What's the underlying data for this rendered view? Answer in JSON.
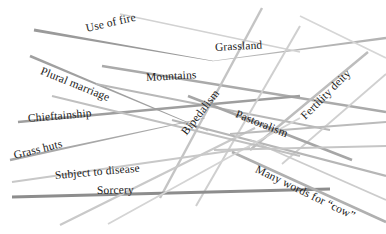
{
  "figure": {
    "background_color": "#ffffff",
    "width": 386,
    "height": 234
  },
  "labels": [
    {
      "text": "Use of fire",
      "x": 86,
      "y": 23,
      "rotate": -13,
      "size": 11.5
    },
    {
      "text": "Grassland",
      "x": 215,
      "y": 42,
      "rotate": -3,
      "size": 11.5
    },
    {
      "text": "Plural marriage",
      "x": 41,
      "y": 65,
      "rotate": 22,
      "size": 11.5
    },
    {
      "text": "Mountains",
      "x": 146,
      "y": 72,
      "rotate": -3,
      "size": 11.5
    },
    {
      "text": "Bipedalism",
      "x": 184,
      "y": 128,
      "rotate": -52,
      "size": 11.5
    },
    {
      "text": "Fertility deity",
      "x": 303,
      "y": 112,
      "rotate": -45,
      "size": 11.5
    },
    {
      "text": "Chieftainship",
      "x": 28,
      "y": 113,
      "rotate": -5,
      "size": 11.5
    },
    {
      "text": "Pastoralism",
      "x": 236,
      "y": 108,
      "rotate": 22,
      "size": 11.5
    },
    {
      "text": "Grass huts",
      "x": 14,
      "y": 150,
      "rotate": -14,
      "size": 11.5
    },
    {
      "text": "Subject to disease",
      "x": 55,
      "y": 170,
      "rotate": -5,
      "size": 11.5
    },
    {
      "text": "Sorcery",
      "x": 97,
      "y": 185,
      "rotate": -1,
      "size": 11.5
    },
    {
      "text": "Many words for “cow”",
      "x": 256,
      "y": 163,
      "rotate": 26,
      "size": 11.5
    }
  ],
  "lines": [
    {
      "name": "line-use-of-fire",
      "x1": 34,
      "y1": 30,
      "x2": 213,
      "y2": 61,
      "width": 3.0,
      "color": "#9a9a9a",
      "taper": "right"
    },
    {
      "name": "line-grassland-long",
      "x1": 213,
      "y1": 61,
      "x2": 386,
      "y2": 38,
      "width": 2.6,
      "color": "#b4b4b4",
      "taper": "left"
    },
    {
      "name": "line-grassland-upper",
      "x1": 120,
      "y1": 14,
      "x2": 300,
      "y2": 52,
      "width": 1.6,
      "color": "#d2d2d2",
      "taper": "none"
    },
    {
      "name": "line-plural-marriage",
      "x1": 30,
      "y1": 56,
      "x2": 208,
      "y2": 131,
      "width": 2.8,
      "color": "#a0a0a0",
      "taper": "right"
    },
    {
      "name": "line-mountains-upper",
      "x1": 102,
      "y1": 66,
      "x2": 386,
      "y2": 112,
      "width": 2.4,
      "color": "#aaaaaa",
      "taper": "none"
    },
    {
      "name": "line-mountains-lower",
      "x1": 96,
      "y1": 84,
      "x2": 330,
      "y2": 130,
      "width": 2.2,
      "color": "#b8b8b8",
      "taper": "none"
    },
    {
      "name": "line-chieftainship",
      "x1": 18,
      "y1": 122,
      "x2": 300,
      "y2": 96,
      "width": 2.6,
      "color": "#9e9e9e",
      "taper": "none"
    },
    {
      "name": "line-bipedalism-steep",
      "x1": 160,
      "y1": 198,
      "x2": 262,
      "y2": 8,
      "width": 2.4,
      "color": "#c4c4c4",
      "taper": "none"
    },
    {
      "name": "line-bipedalism-steep2",
      "x1": 196,
      "y1": 206,
      "x2": 300,
      "y2": 26,
      "width": 2.0,
      "color": "#cfcfcf",
      "taper": "none"
    },
    {
      "name": "line-fertility-deity",
      "x1": 250,
      "y1": 150,
      "x2": 368,
      "y2": 52,
      "width": 2.4,
      "color": "#bdbdbd",
      "taper": "none"
    },
    {
      "name": "line-fertility-deity2",
      "x1": 282,
      "y1": 164,
      "x2": 386,
      "y2": 74,
      "width": 1.8,
      "color": "#d0d0d0",
      "taper": "none"
    },
    {
      "name": "line-pastoralism",
      "x1": 188,
      "y1": 96,
      "x2": 352,
      "y2": 160,
      "width": 2.6,
      "color": "#a6a6a6",
      "taper": "none"
    },
    {
      "name": "line-pastoralism2",
      "x1": 172,
      "y1": 120,
      "x2": 386,
      "y2": 176,
      "width": 2.2,
      "color": "#b6b6b6",
      "taper": "none"
    },
    {
      "name": "line-grass-huts",
      "x1": 10,
      "y1": 160,
      "x2": 205,
      "y2": 118,
      "width": 2.6,
      "color": "#a8a8a8",
      "taper": "right"
    },
    {
      "name": "line-subject-disease",
      "x1": 12,
      "y1": 182,
      "x2": 250,
      "y2": 148,
      "width": 2.2,
      "color": "#c8c8c8",
      "taper": "none"
    },
    {
      "name": "line-sorcery-baseline",
      "x1": 12,
      "y1": 197,
      "x2": 330,
      "y2": 189,
      "width": 3.2,
      "color": "#8d8d8d",
      "taper": "none"
    },
    {
      "name": "line-many-words-cow",
      "x1": 232,
      "y1": 152,
      "x2": 386,
      "y2": 222,
      "width": 2.6,
      "color": "#b0b0b0",
      "taper": "none"
    },
    {
      "name": "line-many-words-cow2",
      "x1": 250,
      "y1": 140,
      "x2": 386,
      "y2": 200,
      "width": 1.8,
      "color": "#cccccc",
      "taper": "none"
    },
    {
      "name": "line-lower-left-rise",
      "x1": 60,
      "y1": 225,
      "x2": 255,
      "y2": 128,
      "width": 2.2,
      "color": "#c9c9c9",
      "taper": "none"
    },
    {
      "name": "line-lower-left-rise2",
      "x1": 108,
      "y1": 224,
      "x2": 300,
      "y2": 118,
      "width": 1.8,
      "color": "#d4d4d4",
      "taper": "none"
    },
    {
      "name": "line-mid-crossing",
      "x1": 52,
      "y1": 96,
      "x2": 300,
      "y2": 156,
      "width": 2.0,
      "color": "#c0c0c0",
      "taper": "none"
    },
    {
      "name": "line-right-converge",
      "x1": 230,
      "y1": 134,
      "x2": 386,
      "y2": 122,
      "width": 2.0,
      "color": "#bbbbbb",
      "taper": "none"
    },
    {
      "name": "line-right-converge2",
      "x1": 214,
      "y1": 150,
      "x2": 386,
      "y2": 146,
      "width": 1.8,
      "color": "#c6c6c6",
      "taper": "none"
    },
    {
      "name": "line-top-right-short",
      "x1": 300,
      "y1": 16,
      "x2": 386,
      "y2": 58,
      "width": 1.6,
      "color": "#d6d6d6",
      "taper": "none"
    }
  ]
}
